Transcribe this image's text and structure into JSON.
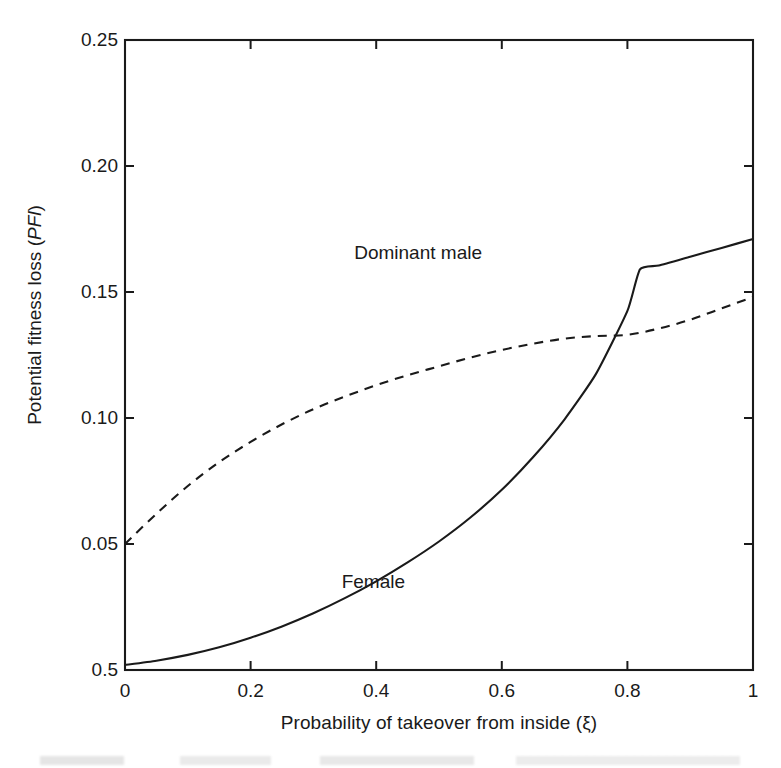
{
  "figure": {
    "background": "#ffffff",
    "ink_color": "#1a1a1a"
  },
  "chart_data": {
    "type": "line",
    "title": "",
    "xlabel": "Probability of takeover from inside (ξ)",
    "ylabel": "Potential fitness loss (PFl)",
    "ylabel_plain": "Potential fitness loss (",
    "ylabel_italic": "PFl",
    "ylabel_close": ")",
    "xlim": [
      0,
      1
    ],
    "ylim": [
      0,
      0.25
    ],
    "grid": false,
    "legend_position": "inline-annotation",
    "x_ticks": [
      0,
      0.2,
      0.4,
      0.6,
      0.8,
      1
    ],
    "x_tick_labels": [
      "0",
      "0.2",
      "0.4",
      "0.6",
      "0.8",
      "1"
    ],
    "y_ticks": [
      0.25,
      0.2,
      0.15,
      0.1,
      0.05,
      0.0
    ],
    "y_tick_labels": [
      "0.25",
      "0.20",
      "0.15",
      "0.10",
      "0.05",
      "0.5"
    ],
    "series": [
      {
        "name": "Dominant male",
        "style": "dashed",
        "color": "#1a1a1a",
        "label_x": 0.365,
        "label_y": 0.165,
        "x": [
          0.0,
          0.05,
          0.1,
          0.15,
          0.2,
          0.25,
          0.3,
          0.35,
          0.4,
          0.45,
          0.5,
          0.55,
          0.6,
          0.65,
          0.7,
          0.75,
          0.8,
          0.85,
          0.9,
          0.95,
          1.0
        ],
        "values": [
          0.05,
          0.062,
          0.073,
          0.0825,
          0.0905,
          0.0975,
          0.1035,
          0.1085,
          0.113,
          0.117,
          0.1205,
          0.124,
          0.127,
          0.1295,
          0.1315,
          0.1325,
          0.133,
          0.1355,
          0.139,
          0.1435,
          0.148
        ]
      },
      {
        "name": "Female",
        "style": "solid",
        "color": "#1a1a1a",
        "label_x": 0.345,
        "label_y": 0.0345,
        "x": [
          0.0,
          0.05,
          0.1,
          0.15,
          0.2,
          0.25,
          0.3,
          0.35,
          0.4,
          0.45,
          0.5,
          0.55,
          0.6,
          0.65,
          0.7,
          0.75,
          0.8,
          0.82,
          0.85,
          0.9,
          0.95,
          1.0
        ],
        "values": [
          0.002,
          0.0037,
          0.006,
          0.009,
          0.0128,
          0.0173,
          0.0225,
          0.0285,
          0.0352,
          0.0427,
          0.051,
          0.0605,
          0.0715,
          0.0845,
          0.0995,
          0.1175,
          0.1425,
          0.159,
          0.1605,
          0.164,
          0.1675,
          0.171
        ]
      }
    ],
    "annotations": [
      {
        "text": "Dominant male",
        "x": 0.365,
        "y": 0.165
      },
      {
        "text": "Female",
        "x": 0.345,
        "y": 0.0345
      }
    ],
    "crossing_point": {
      "x": 0.71,
      "y": 0.132
    },
    "kink_point": {
      "x": 0.82,
      "y": 0.159
    }
  }
}
